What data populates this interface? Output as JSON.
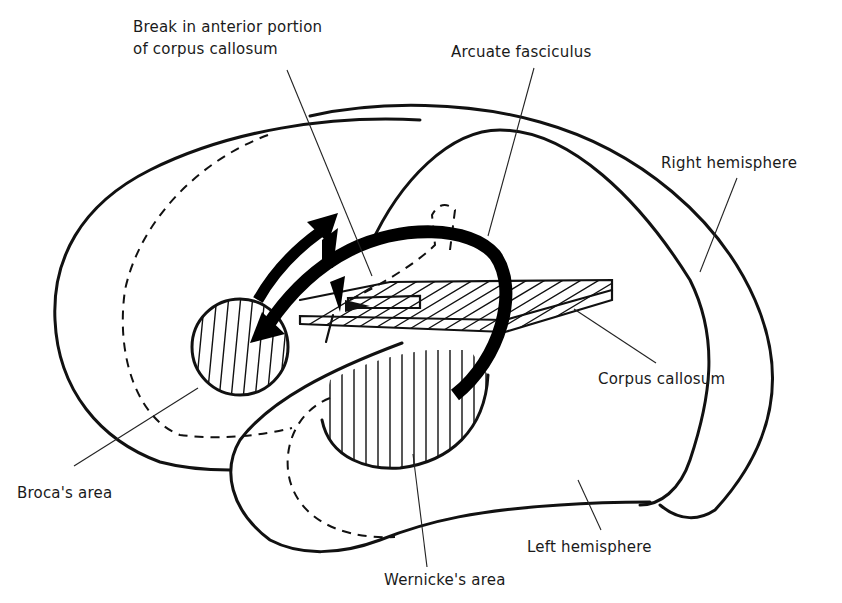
{
  "figure": {
    "colors": {
      "ink": "#111111",
      "background": "#ffffff"
    },
    "labels": {
      "break_line1": "Break in anterior portion",
      "break_line2": "of corpus callosum",
      "arcuate": "Arcuate fasciculus",
      "right_hemisphere": "Right hemisphere",
      "corpus_callosum": "Corpus callosum",
      "brocas_area": "Broca's area",
      "left_hemisphere": "Left hemisphere",
      "wernickes_area": "Wernicke's area"
    }
  }
}
